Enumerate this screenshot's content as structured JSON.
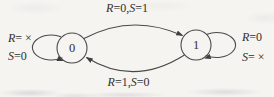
{
  "figure": {
    "colors": {
      "ink": "#3e3e3e",
      "paper": "#f5f4f1"
    },
    "states": [
      {
        "label": "0"
      },
      {
        "label": "1"
      }
    ],
    "transitions": {
      "top": {
        "from": "0",
        "to": "1",
        "label": "R=0,S=1"
      },
      "bottom": {
        "from": "1",
        "to": "0",
        "label": "R=1,S=0"
      },
      "self_left": {
        "state": "0",
        "line1": "R= ×",
        "line2": "S=0"
      },
      "self_right": {
        "state": "1",
        "line1": "R=0",
        "line2": "S= ×"
      }
    }
  }
}
